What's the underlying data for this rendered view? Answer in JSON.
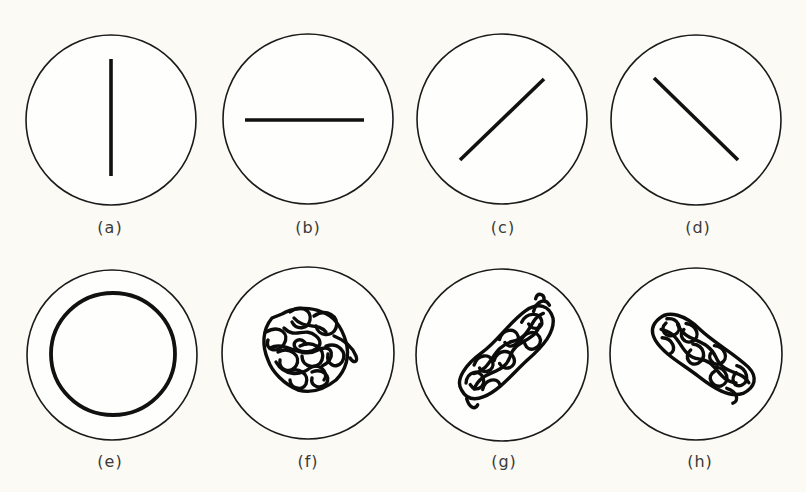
{
  "figure": {
    "background": "#fbfaf4",
    "stroke_color": "#111111",
    "panels": [
      {
        "id": "a",
        "label": "(a)",
        "shape": "rod",
        "orientation": "vertical",
        "cx": 111,
        "cy": 120,
        "r": 85,
        "label_x": 110,
        "label_y": 218
      },
      {
        "id": "b",
        "label": "(b)",
        "shape": "rod",
        "orientation": "horizontal",
        "cx": 308,
        "cy": 119,
        "r": 85,
        "label_x": 308,
        "label_y": 218
      },
      {
        "id": "c",
        "label": "(c)",
        "shape": "rod",
        "orientation": "diagonal-up-right",
        "cx": 502,
        "cy": 119,
        "r": 85,
        "label_x": 503,
        "label_y": 218
      },
      {
        "id": "d",
        "label": "(d)",
        "shape": "rod",
        "orientation": "diagonal-down-right",
        "cx": 696,
        "cy": 120,
        "r": 85,
        "label_x": 698,
        "label_y": 218
      },
      {
        "id": "e",
        "label": "(e)",
        "shape": "ring",
        "orientation": "circular",
        "cx": 112,
        "cy": 355,
        "r": 85,
        "label_x": 110,
        "label_y": 452
      },
      {
        "id": "f",
        "label": "(f)",
        "shape": "random-coil",
        "orientation": "isotropic",
        "cx": 308,
        "cy": 353,
        "r": 86,
        "label_x": 308,
        "label_y": 452
      },
      {
        "id": "g",
        "label": "(g)",
        "shape": "random-coil",
        "orientation": "elongated-up-right",
        "cx": 502,
        "cy": 355,
        "r": 86,
        "label_x": 504,
        "label_y": 452
      },
      {
        "id": "h",
        "label": "(h)",
        "shape": "random-coil",
        "orientation": "elongated-down-right",
        "cx": 696,
        "cy": 354,
        "r": 86,
        "label_x": 700,
        "label_y": 452
      }
    ]
  }
}
